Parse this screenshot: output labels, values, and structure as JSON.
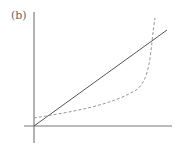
{
  "figure": {
    "panel_label": "(b)",
    "axes": {
      "x_origin_px": 34,
      "y_origin_px": 126,
      "color": "#555555"
    },
    "series": [
      {
        "name": "linear",
        "style": "solid",
        "color": "#555555"
      },
      {
        "name": "convex-asymptotic",
        "style": "dashed",
        "color": "#999999"
      }
    ]
  }
}
